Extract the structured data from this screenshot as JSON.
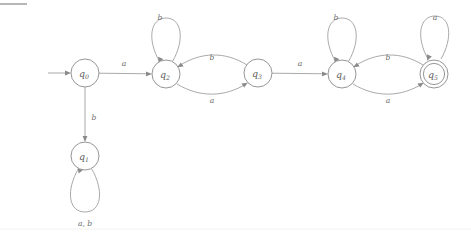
{
  "diagram": {
    "kind": "finite-state-automaton",
    "alphabet": [
      "a",
      "b"
    ],
    "start_state": "q0",
    "accepting_states": [
      "q5"
    ],
    "states": [
      {
        "id": "q0",
        "label": "q",
        "subscript": "0",
        "cx": 85,
        "cy": 73,
        "r": 14,
        "accepting": false
      },
      {
        "id": "q1",
        "label": "q",
        "subscript": "1",
        "cx": 85,
        "cy": 156,
        "r": 14,
        "accepting": false
      },
      {
        "id": "q2",
        "label": "q",
        "subscript": "2",
        "cx": 166,
        "cy": 74,
        "r": 14,
        "accepting": false
      },
      {
        "id": "q3",
        "label": "q",
        "subscript": "3",
        "cx": 258,
        "cy": 73,
        "r": 14,
        "accepting": false
      },
      {
        "id": "q4",
        "label": "q",
        "subscript": "4",
        "cx": 342,
        "cy": 74,
        "r": 14,
        "accepting": false
      },
      {
        "id": "q5",
        "label": "q",
        "subscript": "5",
        "cx": 434,
        "cy": 74,
        "r": 14,
        "accepting": true
      }
    ],
    "start_arrow": {
      "from_x": 48,
      "to_x": 69,
      "y": 73
    },
    "transitions": [
      {
        "from": "q0",
        "to": "q2",
        "symbol": "a",
        "label_x": 124,
        "label_y": 63
      },
      {
        "from": "q0",
        "to": "q1",
        "symbol": "b",
        "label_x": 94,
        "label_y": 117
      },
      {
        "from": "q1",
        "to": "q1",
        "symbol": "a, b",
        "label_x": 85,
        "label_y": 223
      },
      {
        "from": "q2",
        "to": "q2",
        "symbol": "b",
        "label_x": 160,
        "label_y": 17
      },
      {
        "from": "q2",
        "to": "q3",
        "symbol": "a",
        "label_x": 212,
        "label_y": 100
      },
      {
        "from": "q3",
        "to": "q2",
        "symbol": "b",
        "label_x": 212,
        "label_y": 57
      },
      {
        "from": "q3",
        "to": "q4",
        "symbol": "a",
        "label_x": 300,
        "label_y": 63
      },
      {
        "from": "q4",
        "to": "q4",
        "symbol": "b",
        "label_x": 336,
        "label_y": 17
      },
      {
        "from": "q4",
        "to": "q5",
        "symbol": "a",
        "label_x": 388,
        "label_y": 100
      },
      {
        "from": "q5",
        "to": "q4",
        "symbol": "b",
        "label_x": 388,
        "label_y": 57
      },
      {
        "from": "q5",
        "to": "q5",
        "symbol": "a",
        "label_x": 435,
        "label_y": 17
      }
    ]
  },
  "labels": {
    "a": "a",
    "b": "b",
    "ab": "a, b",
    "q0": "q",
    "q1": "q",
    "q2": "q",
    "q3": "q",
    "q4": "q",
    "q5": "q",
    "sub0": "0",
    "sub1": "1",
    "sub2": "2",
    "sub3": "3",
    "sub4": "4",
    "sub5": "5"
  },
  "colors": {
    "stroke": "#8a8a8a",
    "edge": "#9a9a9a",
    "text": "#5d5d5d",
    "background": "#ffffff",
    "rule": "#7d7d7d"
  }
}
